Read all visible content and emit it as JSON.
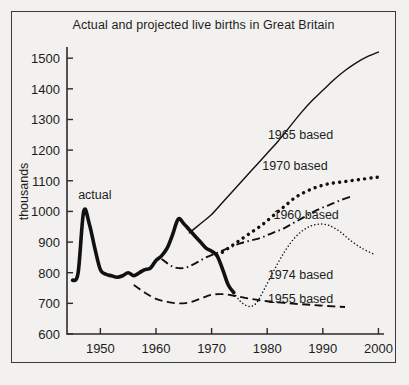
{
  "chart_data": {
    "type": "line",
    "title": "Actual and projected live births in Great Britain",
    "xlabel": "",
    "ylabel": "thousands",
    "xlim": [
      1944,
      2001
    ],
    "ylim": [
      600,
      1530
    ],
    "grid": false,
    "legend_position": "inline-right",
    "y_ticks": [
      600,
      700,
      800,
      900,
      1000,
      1100,
      1200,
      1300,
      1400,
      1500
    ],
    "x_ticks": [
      1950,
      1960,
      1970,
      1980,
      1990,
      2000
    ],
    "x_tick_labels": [
      "1950",
      "1960",
      "1970",
      "1980",
      "1990",
      "2000"
    ],
    "y_tick_labels": [
      "600",
      "700",
      "800",
      "900",
      "1000",
      "1100",
      "1200",
      "1300",
      "1400",
      "1500"
    ],
    "annotations": [
      {
        "text": "actual",
        "x": 1949,
        "y": 1040
      }
    ],
    "series": [
      {
        "name": "actual",
        "label": "actual",
        "style": "solid-thick",
        "points": [
          [
            1945,
            775
          ],
          [
            1946,
            800
          ],
          [
            1947,
            1000
          ],
          [
            1948,
            960
          ],
          [
            1949,
            880
          ],
          [
            1950,
            810
          ],
          [
            1951,
            795
          ],
          [
            1952,
            790
          ],
          [
            1953,
            785
          ],
          [
            1954,
            790
          ],
          [
            1955,
            800
          ],
          [
            1956,
            790
          ],
          [
            1957,
            800
          ],
          [
            1958,
            810
          ],
          [
            1959,
            815
          ],
          [
            1960,
            840
          ],
          [
            1961,
            855
          ],
          [
            1962,
            880
          ],
          [
            1963,
            925
          ],
          [
            1964,
            975
          ],
          [
            1965,
            960
          ],
          [
            1966,
            940
          ],
          [
            1967,
            920
          ],
          [
            1968,
            900
          ],
          [
            1969,
            880
          ],
          [
            1970,
            870
          ],
          [
            1971,
            855
          ],
          [
            1972,
            810
          ],
          [
            1973,
            760
          ],
          [
            1974,
            735
          ]
        ]
      },
      {
        "name": "1965 based",
        "label": "1965 based",
        "style": "solid-thin",
        "points": [
          [
            1966,
            930
          ],
          [
            1968,
            960
          ],
          [
            1970,
            990
          ],
          [
            1972,
            1030
          ],
          [
            1974,
            1070
          ],
          [
            1976,
            1110
          ],
          [
            1978,
            1150
          ],
          [
            1980,
            1190
          ],
          [
            1982,
            1230
          ],
          [
            1984,
            1275
          ],
          [
            1986,
            1320
          ],
          [
            1988,
            1360
          ],
          [
            1990,
            1395
          ],
          [
            1992,
            1430
          ],
          [
            1994,
            1460
          ],
          [
            1996,
            1485
          ],
          [
            1998,
            1505
          ],
          [
            2000,
            1520
          ]
        ]
      },
      {
        "name": "1970 based",
        "label": "1970 based",
        "style": "dotted",
        "points": [
          [
            1971,
            855
          ],
          [
            1973,
            880
          ],
          [
            1975,
            905
          ],
          [
            1977,
            930
          ],
          [
            1979,
            955
          ],
          [
            1981,
            985
          ],
          [
            1983,
            1015
          ],
          [
            1985,
            1045
          ],
          [
            1987,
            1065
          ],
          [
            1989,
            1080
          ],
          [
            1991,
            1090
          ],
          [
            1993,
            1095
          ],
          [
            1995,
            1100
          ],
          [
            1997,
            1105
          ],
          [
            1999,
            1110
          ],
          [
            2000,
            1112
          ]
        ]
      },
      {
        "name": "1960 based",
        "label": "1960 based",
        "style": "dash-dot",
        "points": [
          [
            1961,
            845
          ],
          [
            1963,
            820
          ],
          [
            1965,
            815
          ],
          [
            1967,
            830
          ],
          [
            1969,
            850
          ],
          [
            1971,
            865
          ],
          [
            1973,
            880
          ],
          [
            1975,
            895
          ],
          [
            1977,
            905
          ],
          [
            1979,
            915
          ],
          [
            1981,
            930
          ],
          [
            1983,
            945
          ],
          [
            1985,
            965
          ],
          [
            1987,
            985
          ],
          [
            1989,
            1005
          ],
          [
            1991,
            1020
          ],
          [
            1993,
            1035
          ],
          [
            1995,
            1048
          ]
        ]
      },
      {
        "name": "1974 based",
        "label": "1974 based",
        "style": "fine-dotted",
        "points": [
          [
            1974,
            735
          ],
          [
            1975,
            710
          ],
          [
            1976,
            695
          ],
          [
            1977,
            690
          ],
          [
            1978,
            700
          ],
          [
            1979,
            730
          ],
          [
            1981,
            800
          ],
          [
            1983,
            865
          ],
          [
            1985,
            915
          ],
          [
            1987,
            945
          ],
          [
            1989,
            958
          ],
          [
            1991,
            955
          ],
          [
            1993,
            935
          ],
          [
            1995,
            905
          ],
          [
            1997,
            880
          ],
          [
            1999,
            862
          ]
        ]
      },
      {
        "name": "1955 based",
        "label": "1955 based",
        "style": "dashed",
        "points": [
          [
            1956,
            760
          ],
          [
            1958,
            735
          ],
          [
            1960,
            715
          ],
          [
            1962,
            705
          ],
          [
            1964,
            700
          ],
          [
            1966,
            703
          ],
          [
            1968,
            715
          ],
          [
            1970,
            728
          ],
          [
            1972,
            730
          ],
          [
            1974,
            725
          ],
          [
            1976,
            718
          ],
          [
            1978,
            712
          ],
          [
            1980,
            707
          ],
          [
            1984,
            700
          ],
          [
            1988,
            695
          ],
          [
            1992,
            690
          ],
          [
            1994,
            688
          ]
        ]
      }
    ],
    "series_label_positions": [
      {
        "name": "1965 based",
        "x": 1986,
        "y": 1235
      },
      {
        "name": "1970 based",
        "x": 1985,
        "y": 1135
      },
      {
        "name": "1960 based",
        "x": 1987,
        "y": 975
      },
      {
        "name": "1974 based",
        "x": 1986,
        "y": 780
      },
      {
        "name": "1955 based",
        "x": 1986,
        "y": 700
      }
    ]
  }
}
